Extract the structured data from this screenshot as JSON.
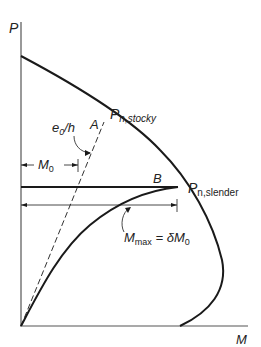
{
  "diagram": {
    "type": "column-interaction-diagram",
    "axes": {
      "y_label": "P",
      "x_label": "M"
    },
    "labels": {
      "p_stocky_main": "P",
      "p_stocky_sub": "n,stocky",
      "p_slender_main": "P",
      "p_slender_sub": "n,slender",
      "point_a": "A",
      "point_b": "B",
      "eccentricity_main": "e",
      "eccentricity_sub": "0",
      "eccentricity_rest": "/h",
      "m0_main": "M",
      "m0_sub": "0",
      "mmax_main": "M",
      "mmax_sub": "max",
      "mmax_eq": " = δM",
      "mmax_eq_sub": "0"
    },
    "colors": {
      "line": "#1a1a1a",
      "axis": "#333333",
      "text": "#222222"
    }
  }
}
